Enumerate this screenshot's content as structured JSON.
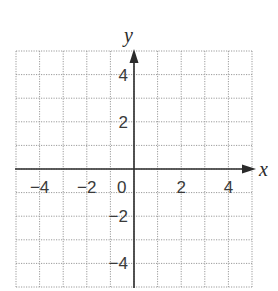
{
  "diagram": {
    "type": "coordinate-grid",
    "axes": {
      "x_label": "x",
      "y_label": "y",
      "x_range": [
        -5,
        5
      ],
      "y_range": [
        -5,
        5
      ],
      "grid_step": 1,
      "label_step": 2
    },
    "x_tick_labels": [
      {
        "value": -4,
        "text": "−4"
      },
      {
        "value": -2,
        "text": "−2"
      },
      {
        "value": 2,
        "text": "2"
      },
      {
        "value": 4,
        "text": "4"
      }
    ],
    "y_tick_labels": [
      {
        "value": 4,
        "text": "4"
      },
      {
        "value": 2,
        "text": "2"
      },
      {
        "value": -2,
        "text": "−2"
      },
      {
        "value": -4,
        "text": "−4"
      }
    ],
    "origin_label": "0",
    "colors": {
      "grid": "#9a9a9a",
      "axis": "#2b2b2b",
      "text": "#3a3a3a"
    }
  }
}
